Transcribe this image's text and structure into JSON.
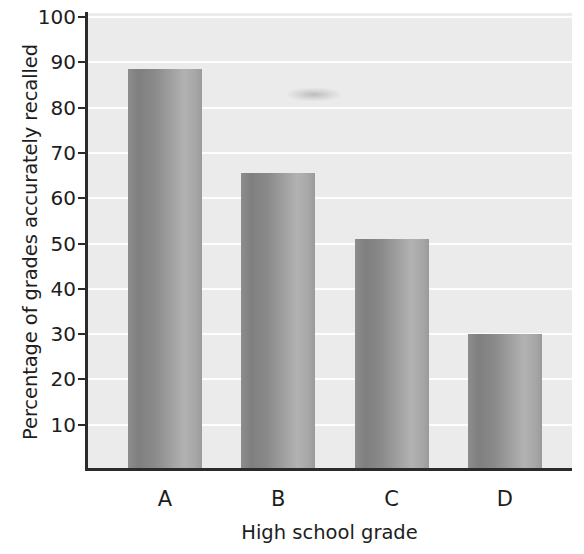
{
  "chart_data": {
    "type": "bar",
    "title": "",
    "xlabel": "High school grade",
    "ylabel": "Percentage of grades accurately recalled",
    "categories": [
      "A",
      "B",
      "C",
      "D"
    ],
    "values": [
      88.5,
      65.5,
      51,
      30
    ],
    "series": [
      {
        "name": "Percentage of grades accurately recalled",
        "values": [
          88.5,
          65.5,
          51,
          30
        ]
      }
    ],
    "ylim": [
      0,
      100
    ],
    "yticks": [
      10,
      20,
      30,
      40,
      50,
      60,
      70,
      80,
      90,
      100
    ],
    "ytick_labels": [
      "10",
      "20",
      "30",
      "40",
      "50",
      "60",
      "70",
      "80",
      "90",
      "100"
    ],
    "grid": true,
    "grid_axis": "y",
    "legend": false,
    "legend_position": "none",
    "colors": {
      "plot_background": "#ebebeb",
      "gridline": "#fdfdfd",
      "axis": "#2b2b2b",
      "bar_dark": "#7f7f7f",
      "bar_light": "#b2b2b2",
      "text": "#1d1d1d",
      "figure_background": "#ffffff"
    }
  }
}
